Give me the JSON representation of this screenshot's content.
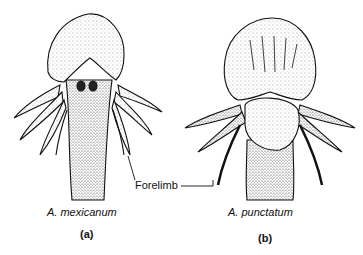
{
  "figure": {
    "panels": [
      {
        "id": "a",
        "species": "A. mexicanum",
        "panel_label": "(a)"
      },
      {
        "id": "b",
        "species": "A. punctatum",
        "panel_label": "(b)"
      }
    ],
    "annotation": "Forelimb"
  }
}
